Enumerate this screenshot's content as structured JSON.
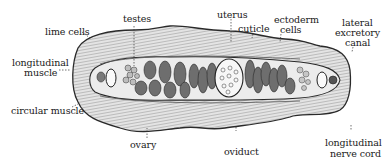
{
  "diagram": {
    "colors": {
      "ink": "#1a1a1a",
      "tissue_light": "#d8d8d8",
      "tissue_mid": "#9a9a9a",
      "organ_dark": "#6e6e6e",
      "background": "#ffffff"
    },
    "labels": {
      "testes": "testes",
      "lime_cells": "lime cells",
      "longitudinal_muscle_1": "longitudinal",
      "longitudinal_muscle_2": "muscle",
      "circular_muscle": "circular muscle",
      "ovary": "ovary",
      "uterus": "uterus",
      "cuticle": "cuticle",
      "ectoderm_cells_1": "ectoderm",
      "ectoderm_cells_2": "cells",
      "lateral_excretory_canal_1": "lateral",
      "lateral_excretory_canal_2": "excretory",
      "lateral_excretory_canal_3": "canal",
      "oviduct": "oviduct",
      "longitudinal_nerve_cord_1": "longitudinal",
      "longitudinal_nerve_cord_2": "nerve cord"
    }
  }
}
